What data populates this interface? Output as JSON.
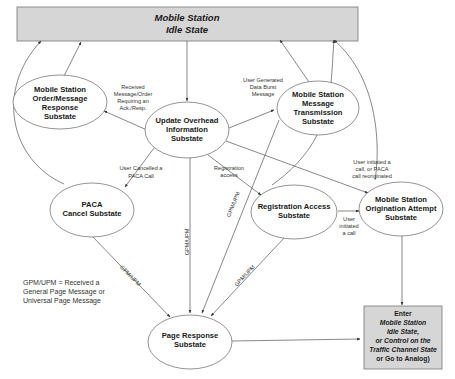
{
  "diagram": {
    "title_box": {
      "line1": "Mobile Station",
      "line2": "Idle State"
    },
    "nodes": {
      "order_response": [
        "Mobile Station",
        "Order/Message",
        "Response",
        "Substate"
      ],
      "update_overhead": [
        "Update Overhead",
        "Information",
        "Substate"
      ],
      "message_transmission": [
        "Mobile Station",
        "Message",
        "Transmission",
        "Substate"
      ],
      "paca_cancel": [
        "PACA",
        "Cancel Substate"
      ],
      "registration_access": [
        "Registration Access",
        "Substate"
      ],
      "origination_attempt": [
        "Mobile Station",
        "Origination Attempt",
        "Substate"
      ],
      "page_response": [
        "Page Response",
        "Substate"
      ]
    },
    "exit_box": [
      "Enter",
      "Mobile Station",
      "Idle State,",
      "or Control on the",
      "Traffic Channel State",
      "or Go to Analog)"
    ],
    "edge_labels": {
      "received_message": [
        "Received",
        "Message/Order",
        "Requiring an",
        "Ack./Resp."
      ],
      "user_generated": [
        "User Generated",
        "Data Burst",
        "Message"
      ],
      "user_cancelled": [
        "User Cancelled a",
        "PACA Call"
      ],
      "registration": [
        "Registration",
        "access"
      ],
      "user_initiated_paca": [
        "User initiated a",
        "call, or PACA",
        "call reoriginated"
      ],
      "user_initiated": [
        "User",
        "initiated",
        "a call"
      ],
      "gpm_upm": "GPM/UPM"
    },
    "legend": [
      "GPM/UPM = Received a",
      "General Page Message or",
      "Universal Page Message"
    ],
    "colors": {
      "box_fill": "#d6d6d6",
      "line": "#555555",
      "text": "#1a1a1a"
    }
  }
}
